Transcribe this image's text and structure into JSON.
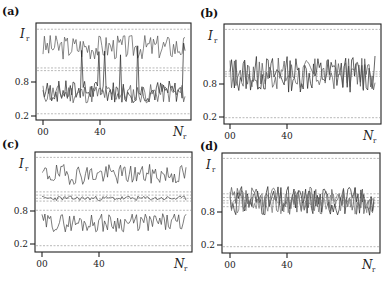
{
  "figure": {
    "ylabel_main": "I",
    "ylabel_sub": "r",
    "xlabel_main": "N",
    "xlabel_sub": "r",
    "ytick_labels": [
      "0.8",
      "0.2"
    ],
    "xtick_labels": [
      "00",
      "40"
    ]
  },
  "chart_data": [
    {
      "panel": "(a)",
      "type": "line",
      "title": "",
      "xlabel": "N_r",
      "ylabel": "I_r",
      "x_ticks": [
        "00",
        "40"
      ],
      "y_ticks": [
        "0.8",
        "0.2"
      ],
      "x_range": [
        0,
        100
      ],
      "y_range": [
        0.0,
        2.0
      ],
      "reference_lines": [
        1.95,
        1.08,
        1.02,
        0.05
      ],
      "series": [
        {
          "name": "upper",
          "color": "#555555",
          "mean": 1.55,
          "amp": 0.28,
          "n": 100,
          "seed": 3
        },
        {
          "name": "lower-1",
          "color": "#222222",
          "mean": 0.55,
          "amp": 0.25,
          "n": 100,
          "seed": 7
        },
        {
          "name": "lower-2",
          "color": "#555555",
          "mean": 0.5,
          "amp": 0.22,
          "n": 100,
          "seed": 11
        }
      ],
      "description": "Two-level bistable intensity: upper branch around 1.5, lower branch around 0.5 with occasional switching"
    },
    {
      "panel": "(b)",
      "type": "line",
      "title": "",
      "xlabel": "N_r",
      "ylabel": "I_r",
      "x_ticks": [
        "00",
        "40"
      ],
      "y_ticks": [
        "0.8",
        "0.2"
      ],
      "x_range": [
        0,
        100
      ],
      "y_range": [
        0.0,
        2.0
      ],
      "reference_lines": [
        1.97,
        1.05,
        1.0,
        0.95,
        0.05
      ],
      "series": [
        {
          "name": "s1",
          "color": "#222222",
          "mean": 1.0,
          "amp": 0.4,
          "n": 100,
          "seed": 13
        },
        {
          "name": "s2",
          "color": "#555555",
          "mean": 1.0,
          "amp": 0.35,
          "n": 100,
          "seed": 17
        }
      ],
      "description": "Intensities fluctuating around 1.0 with amplitude ~0.4"
    },
    {
      "panel": "(c)",
      "type": "line",
      "title": "",
      "xlabel": "N_r",
      "ylabel": "I_r",
      "x_ticks": [
        "00",
        "40"
      ],
      "y_ticks": [
        "0.8",
        "0.2"
      ],
      "x_range": [
        0,
        100
      ],
      "y_range": [
        0.0,
        2.0
      ],
      "reference_lines": [
        1.97,
        1.22,
        1.15,
        1.08,
        1.02,
        0.82,
        0.05
      ],
      "series": [
        {
          "name": "upper",
          "color": "#444444",
          "mean": 1.6,
          "amp": 0.22,
          "n": 100,
          "seed": 19
        },
        {
          "name": "middle",
          "color": "#444444",
          "mean": 1.08,
          "amp": 0.05,
          "n": 100,
          "seed": 23
        },
        {
          "name": "lower",
          "color": "#444444",
          "mean": 0.55,
          "amp": 0.2,
          "n": 100,
          "seed": 29
        }
      ],
      "description": "Three-level state: upper ~1.6, middle ~1.08 with small fluctuation, lower ~0.55"
    },
    {
      "panel": "(d)",
      "type": "line",
      "title": "",
      "xlabel": "N_r",
      "ylabel": "I_r",
      "x_ticks": [
        "00",
        "40"
      ],
      "y_ticks": [
        "0.8",
        "0.2"
      ],
      "x_range": [
        0,
        100
      ],
      "y_range": [
        0.0,
        2.0
      ],
      "reference_lines": [
        1.97,
        1.2,
        1.12,
        1.05,
        1.0,
        0.92,
        0.05
      ],
      "series": [
        {
          "name": "s1",
          "color": "#222222",
          "mean": 1.05,
          "amp": 0.32,
          "n": 100,
          "seed": 31
        },
        {
          "name": "s2",
          "color": "#555555",
          "mean": 1.05,
          "amp": 0.3,
          "n": 100,
          "seed": 37
        },
        {
          "name": "s3",
          "color": "#777777",
          "mean": 1.0,
          "amp": 0.25,
          "n": 100,
          "seed": 41
        }
      ],
      "description": "Multiple intensities fluctuating around 1.0-1.1"
    }
  ],
  "layout": {
    "panels": [
      {
        "label_x": 2,
        "label_y": 15,
        "left": 36,
        "top": 23,
        "right": 191,
        "bottom": 120,
        "ytick_08": 82,
        "ytick_02": 116,
        "xtick_00": 43,
        "xtick_40": 100,
        "ylabel_y": 38
      },
      {
        "label_x": 200,
        "label_y": 17,
        "left": 224,
        "top": 24,
        "right": 381,
        "bottom": 124,
        "ytick_08": 84,
        "ytick_02": 117,
        "xtick_00": 230,
        "xtick_40": 287,
        "ylabel_y": 40
      },
      {
        "label_x": 2,
        "label_y": 148,
        "left": 35,
        "top": 152,
        "right": 192,
        "bottom": 252,
        "ytick_08": 211,
        "ytick_02": 244,
        "xtick_00": 42,
        "xtick_40": 99,
        "ylabel_y": 168
      },
      {
        "label_x": 200,
        "label_y": 150,
        "left": 222,
        "top": 153,
        "right": 380,
        "bottom": 253,
        "ytick_08": 212,
        "ytick_02": 245,
        "xtick_00": 230,
        "xtick_40": 287,
        "ylabel_y": 169
      }
    ]
  }
}
